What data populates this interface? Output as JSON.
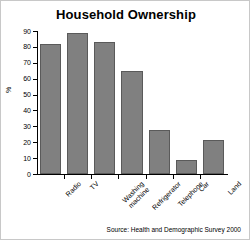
{
  "chart_data": {
    "type": "bar",
    "title": "Household Ownership",
    "xlabel": "",
    "ylabel": "%",
    "categories": [
      "Radio",
      "TV",
      "Washing machine",
      "Refrigerator",
      "Telephone",
      "Car",
      "Land"
    ],
    "values": [
      82,
      89,
      83,
      65,
      28,
      9,
      21.5
    ],
    "ylim": [
      0,
      90
    ],
    "yticks": [
      0,
      10,
      20,
      30,
      40,
      50,
      60,
      70,
      80,
      90
    ],
    "ytick_labels": [
      "0",
      "10",
      "20",
      "30",
      "40",
      "50",
      "60",
      "70",
      "80",
      "90"
    ],
    "grid": false,
    "legend": null,
    "bar_color": "#808080",
    "bar_edge_color": "#5a5a5a",
    "axis_color": "#000000",
    "background": "#ffffff"
  },
  "annotations": {
    "source": "Source: Health and Demographic Survey 2000"
  }
}
